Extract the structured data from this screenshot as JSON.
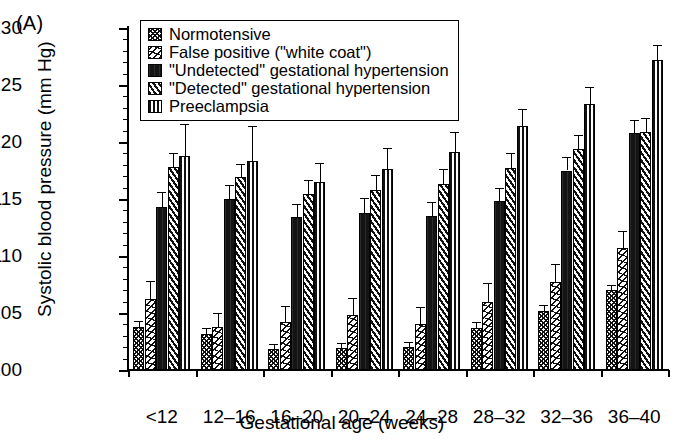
{
  "panel_label": "(A)",
  "chart_data": {
    "type": "bar",
    "title": "",
    "xlabel": "Gestational age (weeks)",
    "ylabel": "Systolic blood pressure (mm Hg)",
    "ylim": [
      100,
      130
    ],
    "ytick_step": 5,
    "yminor_step": 1,
    "yticks": [
      100,
      105,
      110,
      115,
      120,
      125,
      130
    ],
    "grid": false,
    "legend_position": "top-left-inside",
    "categories": [
      "<12",
      "12–16",
      "16–20",
      "20–24",
      "24–28",
      "28–32",
      "32–36",
      "36–40"
    ],
    "series": [
      {
        "name": "Normotensive",
        "pattern": "crosshatch",
        "values": [
          103.8,
          103.2,
          101.8,
          101.9,
          102.0,
          103.7,
          105.2,
          107.0
        ],
        "errors": [
          0.5,
          0.5,
          0.5,
          0.5,
          0.5,
          0.5,
          0.5,
          0.5
        ]
      },
      {
        "name": "False positive (\"white coat\")",
        "pattern": "zigzag",
        "values": [
          106.2,
          103.8,
          104.2,
          104.8,
          104.0,
          106.0,
          107.7,
          110.7
        ],
        "errors": [
          1.6,
          1.2,
          1.4,
          1.5,
          1.5,
          1.6,
          1.6,
          1.5
        ]
      },
      {
        "name": "\"Undetected\" gestational hypertension",
        "pattern": "solid-black",
        "values": [
          114.3,
          115.0,
          113.4,
          113.8,
          113.5,
          114.8,
          117.5,
          120.8
        ],
        "errors": [
          1.3,
          1.2,
          1.2,
          1.3,
          1.2,
          1.2,
          1.2,
          1.1
        ]
      },
      {
        "name": "\"Detected\" gestational hypertension",
        "pattern": "diagonal",
        "values": [
          117.8,
          116.9,
          115.4,
          115.8,
          116.3,
          117.7,
          119.4,
          120.9
        ],
        "errors": [
          1.2,
          1.2,
          1.3,
          1.3,
          1.3,
          1.3,
          1.2,
          1.2
        ]
      },
      {
        "name": "Preeclampsia",
        "pattern": "vertical-lines",
        "values": [
          118.8,
          118.3,
          116.5,
          117.6,
          119.1,
          121.4,
          123.3,
          127.2
        ],
        "errors": [
          2.8,
          3.1,
          1.7,
          1.9,
          1.8,
          1.5,
          1.5,
          1.3
        ]
      }
    ]
  }
}
